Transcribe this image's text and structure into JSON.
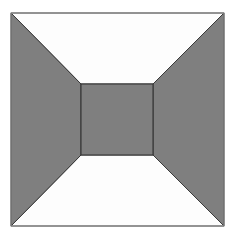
{
  "diagram": {
    "type": "frustum-top-view",
    "outer_square": {
      "x1": 11,
      "y1": 13,
      "x2": 224,
      "y2": 226
    },
    "inner_square": {
      "x1": 81,
      "y1": 84,
      "x2": 153,
      "y2": 155
    },
    "colors": {
      "background": "#ffffff",
      "gray_fill": "#7f7f7f",
      "light_fill": "#fdfdfd",
      "stroke": "#3a3a3a",
      "outer_stroke": "#8a8a8a"
    },
    "regions": [
      {
        "name": "top-face",
        "fill": "light"
      },
      {
        "name": "bottom-face",
        "fill": "light"
      },
      {
        "name": "left-face",
        "fill": "gray"
      },
      {
        "name": "right-face",
        "fill": "gray"
      },
      {
        "name": "center-square",
        "fill": "gray"
      }
    ]
  }
}
